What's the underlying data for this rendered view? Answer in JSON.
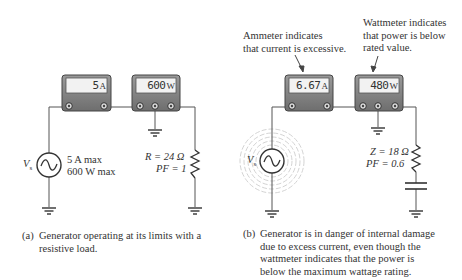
{
  "figure_a": {
    "ammeter": {
      "value": "5",
      "unit": "A"
    },
    "wattmeter": {
      "value": "600",
      "unit": "W"
    },
    "source": {
      "label": "V",
      "subscript": "s",
      "rating_current": "5 A max",
      "rating_power": "600 W max"
    },
    "load": {
      "line1": "R = 24 Ω",
      "line2": "PF = 1"
    },
    "caption": {
      "label": "(a)",
      "text": "Generator operating at its limits with a\nresistive load."
    }
  },
  "figure_b": {
    "ammeter": {
      "value": "6.67",
      "unit": "A"
    },
    "wattmeter": {
      "value": "480",
      "unit": "W"
    },
    "source": {
      "label": "V",
      "subscript": "s"
    },
    "load": {
      "line1": "Z = 18 Ω",
      "line2": "PF = 0.6"
    },
    "annotation_ammeter": "Ammeter indicates\nthat current is excessive.",
    "annotation_wattmeter": "Wattmeter indicates\nthat power is below\nrated value.",
    "caption": {
      "label": "(b)",
      "text": "Generator is in danger of internal damage\ndue to excess current, even though the\nwattmeter indicates that the power is\nbelow the maximum wattage rating."
    }
  },
  "colors": {
    "meter_body": "#8a8a8a",
    "display_bg": "#f2f2f2",
    "wire": "#555555",
    "halo": "#c8c8c8"
  }
}
